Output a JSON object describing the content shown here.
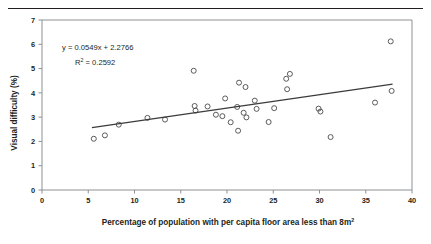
{
  "figure": {
    "divider": "horizontal-rule"
  },
  "chart_data": {
    "type": "scatter",
    "title": "",
    "xlabel": "Percentage of population with per capita floor area less than 8m²",
    "xlabel_base": "Percentage of population with per capita floor area less than 8m",
    "xlabel_sup": "2",
    "ylabel": "Visual difficulty (%)",
    "xlim": [
      0,
      40
    ],
    "ylim": [
      0,
      7
    ],
    "xticks": [
      0,
      5,
      10,
      15,
      20,
      25,
      30,
      35,
      40
    ],
    "xtick_labels": [
      "0",
      "5",
      "10",
      "15",
      "20",
      "25",
      "30",
      "35",
      "40"
    ],
    "yticks": [
      0,
      1,
      2,
      3,
      4,
      5,
      6,
      7
    ],
    "ytick_labels": [
      "0",
      "1",
      "2",
      "3",
      "4",
      "5",
      "6",
      "7"
    ],
    "grid": false,
    "legend": false,
    "marker_style": "open-circle",
    "marker_color": "#4a4a4a",
    "trendline": {
      "type": "linear",
      "slope": 0.0549,
      "intercept": 2.2766,
      "r_squared": 0.2592,
      "equation_label": "y = 0.0549x + 2.2766",
      "r2_label_base": "R",
      "r2_label_sup": "2",
      "r2_label_value": " = 0.2592",
      "x_start": 5.4,
      "x_end": 37.9,
      "color": "#3b3b3b"
    },
    "points": [
      {
        "x": 5.6,
        "y": 2.11
      },
      {
        "x": 6.8,
        "y": 2.25
      },
      {
        "x": 8.3,
        "y": 2.69
      },
      {
        "x": 11.4,
        "y": 2.97
      },
      {
        "x": 13.3,
        "y": 2.9
      },
      {
        "x": 16.4,
        "y": 4.91
      },
      {
        "x": 16.5,
        "y": 3.46
      },
      {
        "x": 16.6,
        "y": 3.27
      },
      {
        "x": 17.9,
        "y": 3.44
      },
      {
        "x": 18.8,
        "y": 3.1
      },
      {
        "x": 19.5,
        "y": 3.04
      },
      {
        "x": 19.8,
        "y": 3.77
      },
      {
        "x": 20.4,
        "y": 2.79
      },
      {
        "x": 21.1,
        "y": 3.42
      },
      {
        "x": 21.2,
        "y": 2.44
      },
      {
        "x": 21.3,
        "y": 4.42
      },
      {
        "x": 21.8,
        "y": 3.18
      },
      {
        "x": 22.0,
        "y": 4.24
      },
      {
        "x": 22.1,
        "y": 2.99
      },
      {
        "x": 23.0,
        "y": 3.68
      },
      {
        "x": 23.2,
        "y": 3.34
      },
      {
        "x": 24.5,
        "y": 2.8
      },
      {
        "x": 25.1,
        "y": 3.37
      },
      {
        "x": 26.4,
        "y": 4.58
      },
      {
        "x": 26.5,
        "y": 4.15
      },
      {
        "x": 26.8,
        "y": 4.78
      },
      {
        "x": 29.9,
        "y": 3.35
      },
      {
        "x": 30.1,
        "y": 3.23
      },
      {
        "x": 31.2,
        "y": 2.18
      },
      {
        "x": 36.0,
        "y": 3.6
      },
      {
        "x": 37.7,
        "y": 6.12
      },
      {
        "x": 37.8,
        "y": 4.08
      }
    ]
  }
}
